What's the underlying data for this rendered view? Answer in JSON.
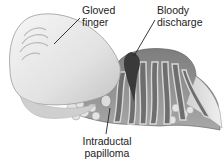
{
  "figure": {
    "labels": {
      "gloved_finger": {
        "line1": "Gloved",
        "line2": "finger"
      },
      "bloody_discharge": {
        "line1": "Bloody",
        "line2": "discharge"
      },
      "intraductal_papilloma": {
        "line1": "Intraductal",
        "line2": "papilloma"
      }
    },
    "colors": {
      "glove": "#e8e8e8",
      "glove_shadow": "#bdbdbd",
      "breast_tissue": "#8f8f8f",
      "ducts": "#6e6e6e",
      "duct_highlight": "#d8d8d8",
      "discharge": "#3a3a3a",
      "fat_lobules": "#dcdcdc"
    }
  }
}
